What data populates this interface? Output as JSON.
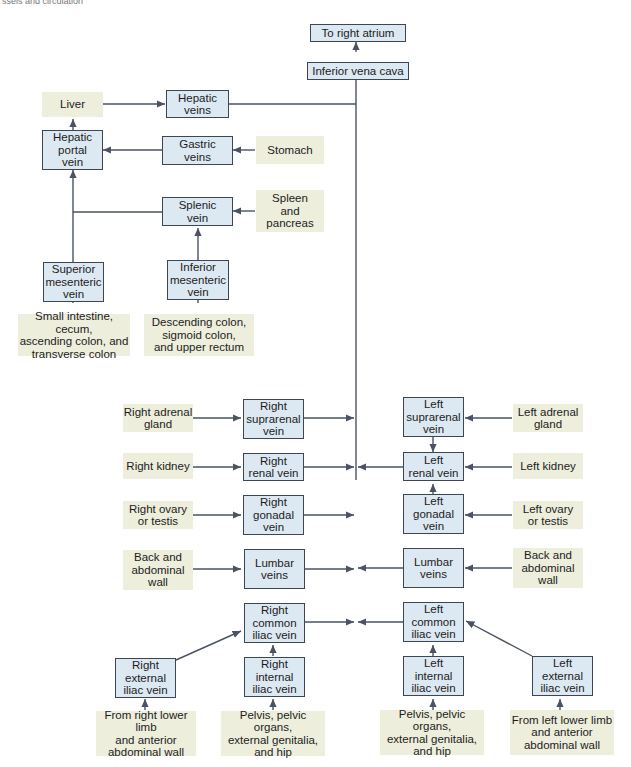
{
  "caption": "ssels and circulation",
  "colors": {
    "vein_fill": "#dce8f2",
    "vein_border": "#3c4654",
    "source_fill": "#eeeedc",
    "line": "#4a5263"
  },
  "nodes": {
    "right_atrium": "To right atrium",
    "ivc": "Inferior vena cava",
    "liver": "Liver",
    "hepatic_veins": "Hepatic\nveins",
    "hepatic_portal": "Hepatic\nportal\nvein",
    "gastric_veins": "Gastric\nveins",
    "stomach": "Stomach",
    "splenic_vein": "Splenic\nvein",
    "spleen": "Spleen\nand\npancreas",
    "sup_mesenteric": "Superior\nmesenteric\nvein",
    "inf_mesenteric": "Inferior\nmesenteric\nvein",
    "small_intestine": "Small intestine, cecum,\nascending colon, and\ntransverse colon",
    "desc_colon": "Descending colon,\nsigmoid colon,\nand upper rectum",
    "r_adrenal": "Right adrenal\ngland",
    "r_suprarenal": "Right\nsuprarenal\nvein",
    "l_suprarenal": "Left\nsuprarenal\nvein",
    "l_adrenal": "Left adrenal\ngland",
    "r_kidney": "Right kidney",
    "r_renal": "Right\nrenal vein",
    "l_renal": "Left\nrenal vein",
    "l_kidney": "Left kidney",
    "r_ovary": "Right ovary\nor testis",
    "r_gonadal": "Right\ngonadal\nvein",
    "l_gonadal": "Left\ngonadal\nvein",
    "l_ovary": "Left ovary\nor testis",
    "r_back": "Back and\nabdominal\nwall",
    "r_lumbar": "Lumbar\nveins",
    "l_lumbar": "Lumbar\nveins",
    "l_back": "Back and\nabdominal\nwall",
    "r_common_iliac": "Right\ncommon\niliac vein",
    "l_common_iliac": "Left\ncommon\niliac vein",
    "r_ext_iliac": "Right\nexternal\niliac vein",
    "r_int_iliac": "Right\ninternal\niliac vein",
    "l_int_iliac": "Left\ninternal\niliac vein",
    "l_ext_iliac": "Left\nexternal\niliac vein",
    "r_lower_limb": "From right lower limb\nand anterior\nabdominal wall",
    "r_pelvis": "Pelvis, pelvic organs,\nexternal genitalia,\nand hip",
    "l_pelvis": "Pelvis, pelvic organs,\nexternal genitalia,\nand hip",
    "l_lower_limb": "From left lower limb\nand anterior\nabdominal wall"
  }
}
